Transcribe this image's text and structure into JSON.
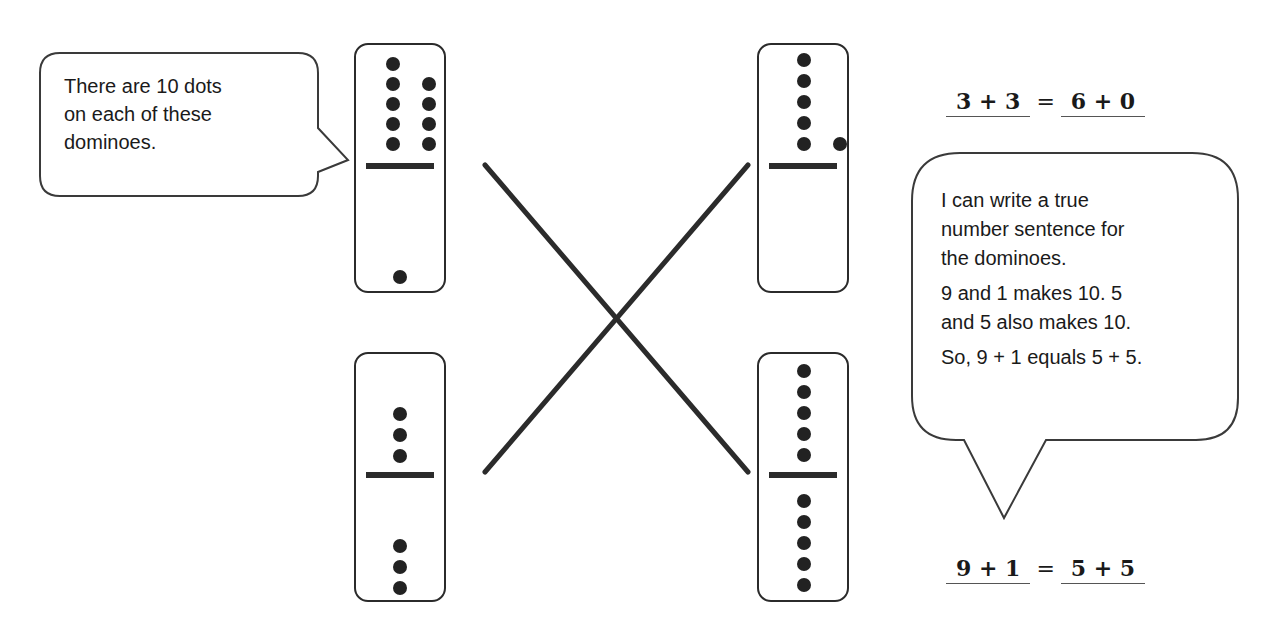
{
  "left_bubble": {
    "lines": [
      "There are 10 dots",
      "on each of these",
      "dominoes."
    ]
  },
  "right_bubble": {
    "lines": [
      "I can write a true",
      "number sentence for",
      "the dominoes.",
      "9 and 1 makes 10.  5",
      "and 5 also makes 10.",
      "So, 9 + 1 equals 5 + 5."
    ]
  },
  "dominoes": {
    "top_left": {
      "top": 9,
      "bottom": 1
    },
    "top_right": {
      "top": 6,
      "bottom": 0
    },
    "bottom_left": {
      "top": 3,
      "bottom": 3
    },
    "bottom_right": {
      "top": 5,
      "bottom": 5
    }
  },
  "equations": {
    "top": {
      "left": "3 + 3",
      "equals": "=",
      "right": "6 + 0"
    },
    "bottom": {
      "left": "9 + 1",
      "equals": "=",
      "right": "5 + 5"
    }
  },
  "matching_lines": [
    {
      "from": "top_left",
      "to": "bottom_right"
    },
    {
      "from": "top_right",
      "to": "bottom_left"
    }
  ]
}
